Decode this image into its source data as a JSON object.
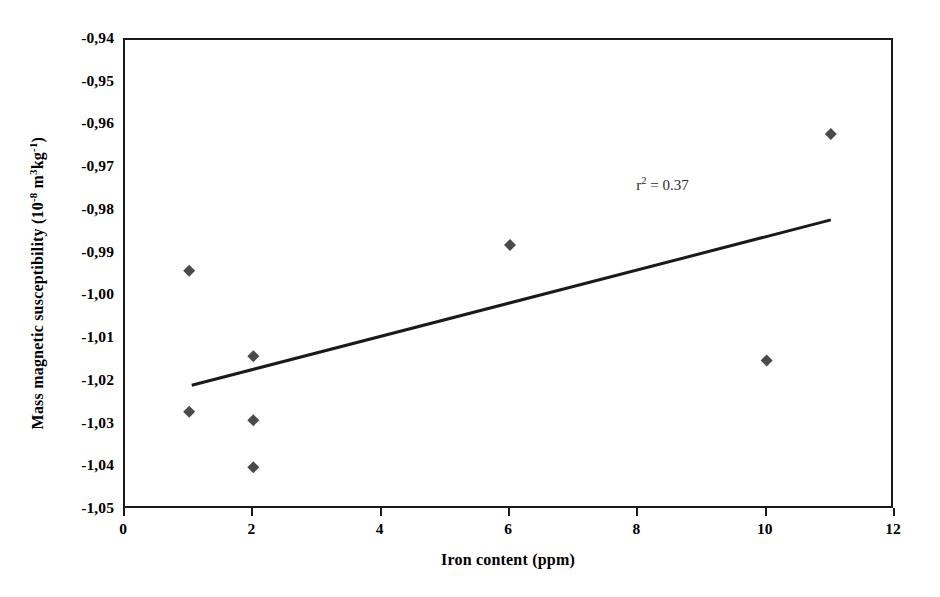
{
  "chart_data": {
    "type": "scatter",
    "title": "",
    "xlabel": "Iron content (ppm)",
    "ylabel_text": "Mass magnetic susceptibility (10 -8 m3kg-1)",
    "ylabel_parts": {
      "main": "Mass magnetic susceptibility (10",
      "exp1": "-8",
      "mid": " m",
      "exp2": "3",
      "unit": "kg",
      "exp3": "-1",
      "close": ")"
    },
    "xlim": [
      0,
      12
    ],
    "ylim": [
      -1.05,
      -0.94
    ],
    "grid": false,
    "legend": null,
    "x_ticks": [
      "0",
      "2",
      "4",
      "6",
      "8",
      "10",
      "12"
    ],
    "x_tick_values": [
      0,
      2,
      4,
      6,
      8,
      10,
      12
    ],
    "y_ticks": [
      "-0,94",
      "-0,95",
      "-0,96",
      "-0,97",
      "-0,98",
      "-0,99",
      "-1,00",
      "-1,01",
      "-1,02",
      "-1,03",
      "-1,04",
      "-1,05"
    ],
    "y_tick_values": [
      -0.94,
      -0.95,
      -0.96,
      -0.97,
      -0.98,
      -0.99,
      -1.0,
      -1.01,
      -1.02,
      -1.03,
      -1.04,
      -1.05
    ],
    "points": [
      {
        "x": 1,
        "y": -0.994
      },
      {
        "x": 1,
        "y": -1.027
      },
      {
        "x": 2,
        "y": -1.014
      },
      {
        "x": 2,
        "y": -1.029
      },
      {
        "x": 2,
        "y": -1.04
      },
      {
        "x": 6,
        "y": -0.988
      },
      {
        "x": 10,
        "y": -1.015
      },
      {
        "x": 11,
        "y": -0.962
      }
    ],
    "marker": {
      "shape": "diamond",
      "color": "#4a4a4a",
      "size": 9
    },
    "trendline": {
      "x_start": 1.04,
      "y_start": -1.0208,
      "x_end": 11.0,
      "y_end": -0.9821,
      "color": "#1a1a1a",
      "width": 3
    },
    "annotations": [
      {
        "text": "r2 = 0.37",
        "prefix": "r",
        "superscript": "2",
        "suffix": " = 0.37",
        "x": 8.0,
        "y": -0.9745
      }
    ],
    "axis_color": "#1a1a1a",
    "background": "#ffffff"
  }
}
